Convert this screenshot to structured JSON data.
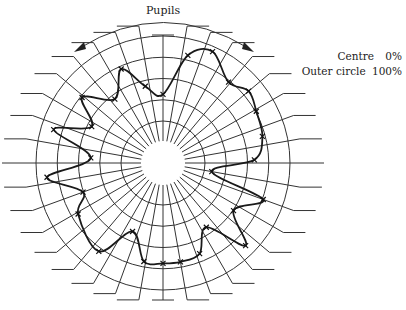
{
  "chart_data": {
    "type": "radar",
    "title": "Pupils",
    "center_px": [
      163,
      163
    ],
    "outer_radius_px": 127,
    "hub_radius_px": 22,
    "rings": [
      20,
      40,
      60,
      80,
      100
    ],
    "scale": {
      "centre": "0%",
      "outer": "100%"
    },
    "spoke_count": 36,
    "spoke_step_deg": 10,
    "series": [
      {
        "name": "Pupils",
        "points": [
          {
            "angle": 0,
            "value": 54
          },
          {
            "angle": 13,
            "value": 87
          },
          {
            "angle": 24,
            "value": 96
          },
          {
            "angle": 39,
            "value": 82
          },
          {
            "angle": 50,
            "value": 88
          },
          {
            "angle": 61,
            "value": 84
          },
          {
            "angle": 75,
            "value": 81
          },
          {
            "angle": 88,
            "value": 72
          },
          {
            "angle": 100,
            "value": 39
          },
          {
            "angle": 110,
            "value": 84
          },
          {
            "angle": 124,
            "value": 67
          },
          {
            "angle": 135,
            "value": 92
          },
          {
            "angle": 146,
            "value": 61
          },
          {
            "angle": 158,
            "value": 77
          },
          {
            "angle": 170,
            "value": 79
          },
          {
            "angle": 180,
            "value": 79
          },
          {
            "angle": 191,
            "value": 79
          },
          {
            "angle": 204,
            "value": 59
          },
          {
            "angle": 216,
            "value": 86
          },
          {
            "angle": 239,
            "value": 78
          },
          {
            "angle": 250,
            "value": 67
          },
          {
            "angle": 263,
            "value": 92
          },
          {
            "angle": 274,
            "value": 57
          },
          {
            "angle": 287,
            "value": 90
          },
          {
            "angle": 297,
            "value": 63
          },
          {
            "angle": 309,
            "value": 82
          },
          {
            "angle": 323,
            "value": 63
          },
          {
            "angle": 336,
            "value": 81
          },
          {
            "angle": 347,
            "value": 62
          }
        ]
      }
    ],
    "colors": {
      "grid": "#333333",
      "line": "#1a1a1a",
      "text": "#222222"
    }
  },
  "labels": {
    "title": "Pupils",
    "legend_centre_label": "Centre",
    "legend_centre_value": "0%",
    "legend_outer_label": "Outer circle",
    "legend_outer_value": "100%"
  }
}
